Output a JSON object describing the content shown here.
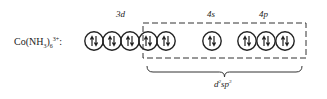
{
  "diagram": {
    "complex": {
      "base": "Co(NH",
      "sub1": "3",
      "close": ")",
      "sub2": "6",
      "charge": "3+",
      "colon": ":"
    },
    "orbital_labels": [
      {
        "text": "3d",
        "x": 122
      },
      {
        "text": "4s",
        "x": 212
      },
      {
        "text": "4p",
        "x": 264
      }
    ],
    "orbitals": [
      {
        "group": "3d",
        "cx": 94,
        "electrons": "paired"
      },
      {
        "group": "3d",
        "cx": 112,
        "electrons": "paired"
      },
      {
        "group": "3d",
        "cx": 130,
        "electrons": "paired"
      },
      {
        "group": "3d",
        "cx": 148,
        "electrons": "paired"
      },
      {
        "group": "3d",
        "cx": 166,
        "electrons": "paired"
      },
      {
        "group": "4s",
        "cx": 212,
        "electrons": "paired"
      },
      {
        "group": "4p",
        "cx": 247,
        "electrons": "paired"
      },
      {
        "group": "4p",
        "cx": 266,
        "electrons": "paired"
      },
      {
        "group": "4p",
        "cx": 285,
        "electrons": "paired"
      }
    ],
    "hybrid_box": {
      "x1": 143,
      "y1": 23,
      "x2": 306,
      "y2": 58,
      "style": "dashed"
    },
    "brace": {
      "x1": 147,
      "x2": 302,
      "y": 66
    },
    "hybrid_label": {
      "d": "d",
      "sup1": "2",
      "sp": "sp",
      "sup2": "3"
    },
    "colors": {
      "ink": "#222222",
      "background": "#ffffff"
    }
  }
}
